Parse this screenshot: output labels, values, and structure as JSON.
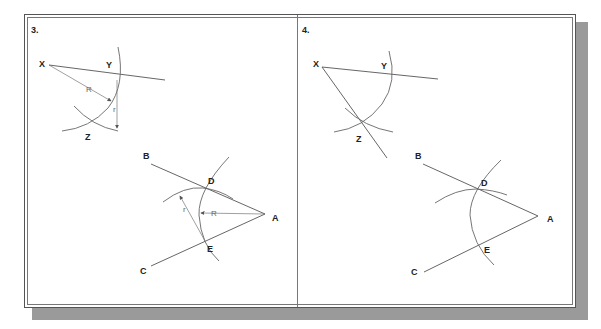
{
  "figure": {
    "panels": [
      {
        "number": "3.",
        "labels": {
          "x": "X",
          "y": "Y",
          "z": "Z",
          "a": "A",
          "b": "B",
          "c": "C",
          "d": "D",
          "e": "E",
          "radius_big": "R",
          "radius_small": "r",
          "radius_big_top": "R",
          "radius_small_top": "r"
        }
      },
      {
        "number": "4.",
        "labels": {
          "x": "X",
          "y": "Y",
          "z": "Z",
          "a": "A",
          "b": "B",
          "c": "C",
          "d": "D",
          "e": "E"
        }
      }
    ]
  }
}
